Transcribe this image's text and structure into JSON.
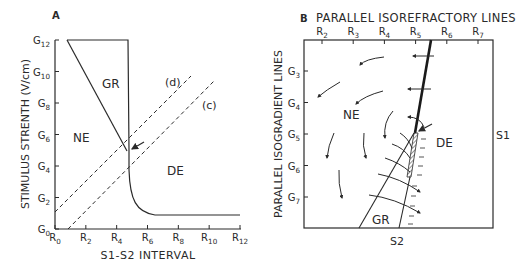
{
  "panel_a": {
    "letter": "A",
    "ylabel": "STIMULUS STRENTH  (V/cm)",
    "xlabel": "S1-S2  INTERVAL",
    "y_ticks": [
      {
        "base": "G",
        "sub": "0",
        "value": 0
      },
      {
        "base": "G",
        "sub": "2",
        "value": 2
      },
      {
        "base": "G",
        "sub": "4",
        "value": 4
      },
      {
        "base": "G",
        "sub": "6",
        "value": 6
      },
      {
        "base": "G",
        "sub": "8",
        "value": 8
      },
      {
        "base": "G",
        "sub": "10",
        "value": 10
      },
      {
        "base": "G",
        "sub": "12",
        "value": 12
      }
    ],
    "x_ticks": [
      {
        "base": "R",
        "sub": "0",
        "value": 0
      },
      {
        "base": "R",
        "sub": "2",
        "value": 2
      },
      {
        "base": "R",
        "sub": "4",
        "value": 4
      },
      {
        "base": "R",
        "sub": "6",
        "value": 6
      },
      {
        "base": "R",
        "sub": "8",
        "value": 8
      },
      {
        "base": "R",
        "sub": "10",
        "value": 10
      },
      {
        "base": "R",
        "sub": "12",
        "value": 12
      }
    ],
    "regions": {
      "gr": "GR",
      "ne": "NE",
      "de": "DE"
    },
    "dashed_labels": {
      "d": "(d)",
      "c": "(c)"
    }
  },
  "panel_b": {
    "letter": "B",
    "title": "PARALLEL ISOREFRACTORY LINES",
    "ylabel": "PARALLEL ISOGRADIENT LINES",
    "x_ticks": [
      {
        "base": "R",
        "sub": "2"
      },
      {
        "base": "R",
        "sub": "3"
      },
      {
        "base": "R",
        "sub": "4"
      },
      {
        "base": "R",
        "sub": "5"
      },
      {
        "base": "R",
        "sub": "6"
      },
      {
        "base": "R",
        "sub": "7"
      }
    ],
    "y_ticks": [
      {
        "base": "G",
        "sub": "3"
      },
      {
        "base": "G",
        "sub": "4"
      },
      {
        "base": "G",
        "sub": "5"
      },
      {
        "base": "G",
        "sub": "6"
      },
      {
        "base": "G",
        "sub": "7"
      }
    ],
    "regions": {
      "ne": "NE",
      "de": "DE",
      "gr": "GR"
    },
    "s1_label": "S1",
    "s2_label": "S2"
  }
}
